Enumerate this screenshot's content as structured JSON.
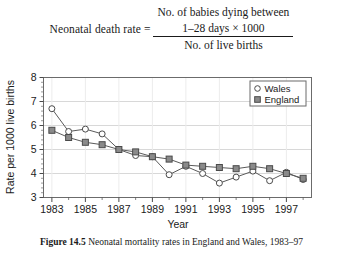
{
  "formula": {
    "lhs": "Neonatal death rate =",
    "numerator_line1": "No. of babies dying between",
    "numerator_line2": "1–28 days × 1000",
    "denominator": "No. of live births"
  },
  "caption": {
    "label": "Figure 14.5",
    "text": "Neonatal mortality rates in England and Wales, 1983–97"
  },
  "chart_data": {
    "type": "line",
    "title": "",
    "xlabel": "Year",
    "ylabel": "Rate per 1000 live births",
    "x": [
      1983,
      1984,
      1985,
      1986,
      1987,
      1988,
      1989,
      1990,
      1991,
      1992,
      1993,
      1994,
      1995,
      1996,
      1997,
      1998
    ],
    "xlim": [
      1982.5,
      1998.5
    ],
    "ylim": [
      3,
      8
    ],
    "yticks": [
      3,
      4,
      5,
      6,
      7,
      8
    ],
    "xticks": [
      1983,
      1985,
      1987,
      1989,
      1991,
      1993,
      1995,
      1997
    ],
    "xtick_labels": [
      "1983",
      "1985",
      "1987",
      "1989",
      "1991",
      "1993",
      "1995",
      "1997"
    ],
    "ytick_labels": [
      "3",
      "4",
      "5",
      "6",
      "7",
      "8"
    ],
    "grid": true,
    "legend_position": "top-right",
    "series": [
      {
        "name": "Wales",
        "marker": "open-circle",
        "color": "#3d3d3d",
        "values": [
          6.7,
          5.75,
          5.85,
          5.65,
          5.0,
          4.75,
          4.7,
          3.95,
          4.3,
          4.0,
          3.6,
          3.85,
          4.1,
          3.7,
          4.05,
          3.75
        ]
      },
      {
        "name": "England",
        "marker": "filled-square",
        "color": "#8a8a8a",
        "values": [
          5.8,
          5.5,
          5.3,
          5.2,
          5.0,
          4.9,
          4.7,
          4.6,
          4.35,
          4.3,
          4.25,
          4.2,
          4.3,
          4.2,
          4.0,
          3.8
        ]
      }
    ],
    "legend": [
      {
        "label": "Wales",
        "marker": "open-circle"
      },
      {
        "label": "England",
        "marker": "filled-square"
      }
    ]
  }
}
